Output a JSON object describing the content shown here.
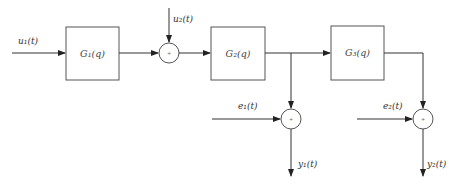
{
  "diagram": {
    "type": "block-diagram",
    "blocks": [
      {
        "id": "G1",
        "label": "G₁(q)"
      },
      {
        "id": "G2",
        "label": "G₂(q)"
      },
      {
        "id": "G3",
        "label": "G₃(q)"
      }
    ],
    "inputs": {
      "u1": "u₁(t)",
      "u2": "u₂(t)",
      "e1": "e₁(t)",
      "e2": "e₂(t)"
    },
    "outputs": {
      "y1": "y₁(t)",
      "y2": "y₂(t)"
    },
    "junctions": {
      "sum1": "+",
      "sum2": "+",
      "sum3": "+"
    },
    "connections": [
      "u1 -> G1",
      "G1 -> sum1",
      "u2 -> sum1",
      "sum1 -> G2",
      "G2 -> G3",
      "G2 -> sum2",
      "e1 -> sum2",
      "sum2 -> y1",
      "G3 -> sum3",
      "e2 -> sum3",
      "sum3 -> y2"
    ]
  }
}
